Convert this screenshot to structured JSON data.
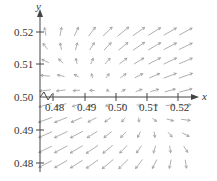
{
  "chart_data": {
    "type": "vector_field",
    "title": "",
    "xlabel": "x",
    "ylabel": "y",
    "xlim": [
      0.475,
      0.525
    ],
    "ylim": [
      0.478,
      0.522
    ],
    "x_ticks": [
      "0.48",
      "0.49",
      "0.50",
      "0.51",
      "0.52"
    ],
    "y_ticks": [
      "0.52",
      "0.51",
      "0.50",
      "0.49",
      "0.48"
    ],
    "grid": false,
    "axes_break_at_origin": true,
    "colors": {
      "axis": "#444444",
      "vector": "#9a9a9a",
      "text": "#333333"
    },
    "vectors": {
      "cols_x": [
        0.4775,
        0.4825,
        0.4875,
        0.4925,
        0.4975,
        0.5025,
        0.5075,
        0.5125,
        0.5175,
        0.5225
      ],
      "rows_y": [
        0.52,
        0.5155,
        0.511,
        0.5065,
        0.502,
        0.4975,
        0.493,
        0.4885,
        0.484,
        0.4795
      ]
    }
  },
  "axes": {
    "x_label": "x",
    "y_label": "y",
    "x_tick_labels": [
      "0.48",
      "0.49",
      "0.50",
      "0.51",
      "0.52"
    ],
    "y_tick_labels": [
      "0.52",
      "0.51",
      "0.50",
      "0.49",
      "0.48"
    ]
  }
}
